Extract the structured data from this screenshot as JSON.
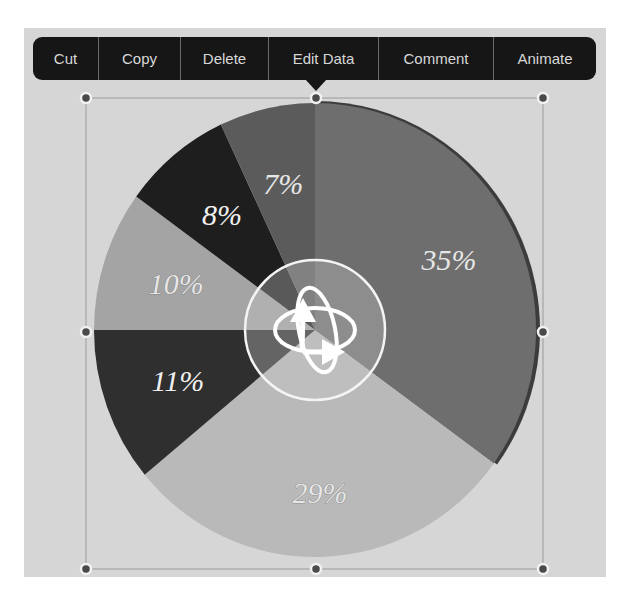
{
  "toolbar": {
    "items": [
      {
        "label": "Cut",
        "width": 66
      },
      {
        "label": "Copy",
        "width": 82
      },
      {
        "label": "Delete",
        "width": 88
      },
      {
        "label": "Edit Data",
        "width": 110
      },
      {
        "label": "Comment",
        "width": 115
      },
      {
        "label": "Animate",
        "width": 102
      }
    ]
  },
  "center_control": {
    "icon": "rotate-3d-icon"
  },
  "colors": {
    "background": "#d6d6d6",
    "toolbar": "#161616",
    "toolbar_text": "#d8d8d8"
  },
  "chart_data": {
    "type": "pie",
    "title": "",
    "start_angle_deg": 0,
    "direction": "clockwise",
    "slices": [
      {
        "label": "35%",
        "value": 35,
        "color": "#6e6e6e"
      },
      {
        "label": "29%",
        "value": 29,
        "color": "#b9b9b9"
      },
      {
        "label": "11%",
        "value": 11,
        "color": "#2f2f2f"
      },
      {
        "label": "10%",
        "value": 10,
        "color": "#a4a4a4"
      },
      {
        "label": "8%",
        "value": 8,
        "color": "#1e1e1e"
      },
      {
        "label": "7%",
        "value": 7,
        "color": "#5b5b5b"
      }
    ],
    "legend": "none",
    "data_labels": [
      "35%",
      "29%",
      "11%",
      "10%",
      "8%",
      "7%"
    ]
  }
}
